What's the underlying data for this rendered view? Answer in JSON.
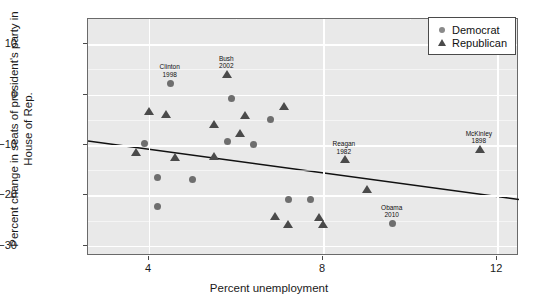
{
  "chart_data": {
    "type": "scatter",
    "title": "",
    "xlabel": "Percent unemployment",
    "ylabel": "Percent change in seats of president's party in House of Rep.",
    "xlim": [
      2.6,
      12.5
    ],
    "ylim": [
      -32,
      15
    ],
    "xticks": [
      4,
      8,
      12
    ],
    "yticks": [
      10,
      0,
      -10,
      -20,
      -30
    ],
    "grid": true,
    "grid_color": "#ffffff",
    "panel_background": "#e9e9e9",
    "legend": {
      "position": "top-right",
      "entries": [
        {
          "label": "Democrat",
          "marker": "circle",
          "color": "#8a8a8a"
        },
        {
          "label": "Republican",
          "marker": "triangle",
          "color": "#4a4a4a"
        }
      ]
    },
    "series": [
      {
        "name": "Democrat",
        "marker": "circle",
        "color": "#6e6e6e",
        "points": [
          {
            "x": 4.5,
            "y": 2.3,
            "label": "Clinton",
            "year": "1998"
          },
          {
            "x": 5.9,
            "y": -0.8,
            "label": "",
            "year": ""
          },
          {
            "x": 6.8,
            "y": -5.0,
            "label": "",
            "year": ""
          },
          {
            "x": 3.9,
            "y": -9.6,
            "label": "",
            "year": ""
          },
          {
            "x": 5.8,
            "y": -9.3,
            "label": "",
            "year": ""
          },
          {
            "x": 6.4,
            "y": -9.9,
            "label": "",
            "year": ""
          },
          {
            "x": 4.2,
            "y": -16.4,
            "label": "",
            "year": ""
          },
          {
            "x": 5.0,
            "y": -16.8,
            "label": "",
            "year": ""
          },
          {
            "x": 4.2,
            "y": -22.1,
            "label": "",
            "year": ""
          },
          {
            "x": 7.2,
            "y": -20.7,
            "label": "",
            "year": ""
          },
          {
            "x": 7.7,
            "y": -20.7,
            "label": "",
            "year": ""
          },
          {
            "x": 9.6,
            "y": -25.6,
            "label": "Obama",
            "year": "2010"
          }
        ]
      },
      {
        "name": "Republican",
        "marker": "triangle",
        "color": "#4a4a4a",
        "points": [
          {
            "x": 5.8,
            "y": 3.9,
            "label": "Bush",
            "year": "2002"
          },
          {
            "x": 4.0,
            "y": -3.4,
            "label": "",
            "year": ""
          },
          {
            "x": 4.4,
            "y": -4.0,
            "label": "",
            "year": ""
          },
          {
            "x": 6.2,
            "y": -4.3,
            "label": "",
            "year": ""
          },
          {
            "x": 7.1,
            "y": -2.4,
            "label": "",
            "year": ""
          },
          {
            "x": 5.5,
            "y": -6.0,
            "label": "",
            "year": ""
          },
          {
            "x": 6.1,
            "y": -7.8,
            "label": "",
            "year": ""
          },
          {
            "x": 3.7,
            "y": -11.6,
            "label": "",
            "year": ""
          },
          {
            "x": 4.6,
            "y": -12.6,
            "label": "",
            "year": ""
          },
          {
            "x": 5.5,
            "y": -12.4,
            "label": "",
            "year": ""
          },
          {
            "x": 11.6,
            "y": -10.9,
            "label": "McKinley",
            "year": "1898"
          },
          {
            "x": 8.5,
            "y": -13.0,
            "label": "Reagan",
            "year": "1982"
          },
          {
            "x": 9.0,
            "y": -19.0,
            "label": "",
            "year": ""
          },
          {
            "x": 6.9,
            "y": -24.2,
            "label": "",
            "year": ""
          },
          {
            "x": 7.2,
            "y": -25.9,
            "label": "",
            "year": ""
          },
          {
            "x": 7.9,
            "y": -24.4,
            "label": "",
            "year": ""
          },
          {
            "x": 8.0,
            "y": -25.9,
            "label": "",
            "year": ""
          }
        ]
      }
    ],
    "trendline": {
      "type": "linear",
      "color": "#111111",
      "from": {
        "x": 2.6,
        "y": -9.2
      },
      "to": {
        "x": 12.5,
        "y": -20.8
      }
    }
  }
}
